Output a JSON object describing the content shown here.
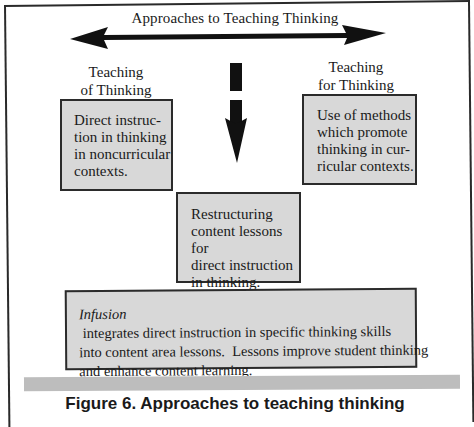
{
  "diagram": {
    "title": "Approaches to Teaching Thinking",
    "left_label": {
      "line1": "Teaching",
      "line2": "of Thinking"
    },
    "right_label": {
      "line1": "Teaching",
      "line2": "for Thinking"
    },
    "left_box": {
      "lines": [
        "Direct instruc-",
        "tion in thinking",
        "in noncurricular",
        "contexts."
      ]
    },
    "right_box": {
      "lines": [
        "Use of methods",
        "which promote",
        "thinking in cur-",
        "ricular contexts."
      ]
    },
    "middle_box": {
      "lines": [
        "Restructuring",
        "content lessons for",
        "direct instruction",
        "in thinking."
      ]
    },
    "bottom_box": {
      "italic_term": "Infusion",
      "line1_rest": " integrates direct instruction in specific thinking skills",
      "line2": "into content area lessons.  Lessons improve student thinking",
      "line3": "and enhance content learning."
    },
    "caption": "Figure 6. Approaches to teaching thinking",
    "colors": {
      "box_fill": "#d8d8d8",
      "border": "#2b2b2b",
      "arrow": "#111111",
      "bar": "#bdbdbd"
    },
    "icons": {
      "horizontal_arrow": "double-headed-arrow-icon",
      "vertical_arrow": "down-arrow-icon"
    }
  }
}
